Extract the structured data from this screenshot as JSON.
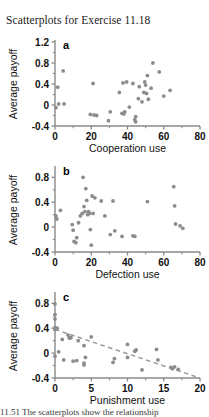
{
  "figure": {
    "title": "Scatterplots for Exercise 11.18",
    "bottom_caption": "11.51 The scatterplots show the relationship",
    "point_color": "#8c8c8c",
    "axis_color": "#8a8a8a",
    "text_color": "#111111",
    "trendline_color": "#9a9a9a"
  },
  "chart_data": [
    {
      "type": "scatter",
      "panel": "a",
      "title": "",
      "xlabel": "Cooperation use",
      "ylabel": "Average payoff",
      "xlim": [
        0,
        80
      ],
      "ylim": [
        -0.4,
        1.2
      ],
      "xticks": [
        0,
        20,
        40,
        60,
        80
      ],
      "yticks": [
        -0.4,
        0,
        0.4,
        0.8,
        1.2
      ],
      "xtick_labels": [
        "0",
        "20",
        "40",
        "60",
        "80"
      ],
      "ytick_labels": [
        "-0.4",
        "0",
        "0.4",
        "0.8",
        "1.2"
      ],
      "grid": false,
      "legend": "none",
      "x": [
        0.5,
        1.5,
        2.0,
        4.5,
        5.0,
        19.5,
        21.0,
        21.5,
        23.0,
        29.5,
        30.5,
        35.5,
        37.0,
        37.5,
        38.0,
        38.5,
        39.5,
        41.0,
        43.0,
        44.0,
        44.5,
        44.5,
        46.0,
        46.5,
        48.0,
        49.0,
        49.5,
        50.0,
        50.5,
        51.0,
        51.5,
        53.0,
        54.0,
        57.5,
        60.0,
        63.5
      ],
      "y": [
        -0.05,
        0.34,
        0.02,
        0.65,
        0.02,
        -0.18,
        0.41,
        -0.19,
        -0.2,
        -0.3,
        -0.13,
        0.24,
        -0.16,
        0.42,
        -0.17,
        -0.13,
        0.44,
        -0.04,
        0.41,
        -0.28,
        -0.32,
        -0.22,
        0.12,
        0.35,
        0.06,
        0.24,
        0.44,
        0.38,
        0.22,
        0.56,
        0.11,
        0.32,
        0.8,
        0.63,
        0.17,
        0.28
      ]
    },
    {
      "type": "scatter",
      "panel": "b",
      "title": "",
      "xlabel": "Defection use",
      "ylabel": "Average payoff",
      "xlim": [
        0,
        80
      ],
      "ylim": [
        -0.4,
        0.95
      ],
      "xticks": [
        0,
        20,
        40,
        60,
        80
      ],
      "yticks": [
        -0.4,
        0,
        0.4,
        0.8
      ],
      "xtick_labels": [
        "0",
        "20",
        "40",
        "60",
        "80"
      ],
      "ytick_labels": [
        "-0.4",
        "0",
        "0.4",
        "0.8"
      ],
      "grid": false,
      "legend": "none",
      "x": [
        0.5,
        1.0,
        3.0,
        9.5,
        10.0,
        10.5,
        11.5,
        12.0,
        13.0,
        14.0,
        15.0,
        15.5,
        16.0,
        16.5,
        17.0,
        17.5,
        18.0,
        18.5,
        19.0,
        19.5,
        20.0,
        20.5,
        21.0,
        22.0,
        25.5,
        27.5,
        30.5,
        32.0,
        33.0,
        37.0,
        43.0,
        44.0,
        51.0,
        65.5,
        66.0,
        66.5,
        69.0,
        70.5
      ],
      "y": [
        0.18,
        0.13,
        0.27,
        0.04,
        -0.05,
        -0.23,
        -0.25,
        -0.17,
        0.07,
        0.18,
        0.22,
        0.8,
        0.33,
        0.25,
        0.62,
        0.43,
        0.2,
        0.25,
        0.22,
        -0.04,
        -0.29,
        0.5,
        0.22,
        0.47,
        0.42,
        0.18,
        -0.12,
        0.42,
        -0.06,
        -0.15,
        -0.14,
        -0.15,
        0.41,
        0.65,
        0.34,
        0.05,
        0.02,
        -0.02
      ]
    },
    {
      "type": "scatter",
      "panel": "c",
      "title": "",
      "xlabel": "Punishment use",
      "ylabel": "Average payoff",
      "xlim": [
        0,
        20
      ],
      "ylim": [
        -0.4,
        0.95
      ],
      "xticks": [
        0,
        5,
        10,
        15,
        20
      ],
      "yticks": [
        -0.4,
        0,
        0.4,
        0.8
      ],
      "xtick_labels": [
        "0",
        "5",
        "10",
        "15",
        "20"
      ],
      "ytick_labels": [
        "-0.4",
        "0",
        "0.4",
        "0.8"
      ],
      "grid": false,
      "legend": "none",
      "x": [
        0.0,
        0.0,
        0.0,
        0.0,
        0.0,
        0.0,
        0.3,
        0.5,
        1.0,
        1.2,
        1.8,
        2.0,
        2.0,
        2.2,
        2.5,
        3.0,
        3.2,
        4.0,
        4.0,
        4.0,
        4.2,
        5.0,
        8.0,
        8.2,
        10.0,
        10.0,
        11.0,
        11.2,
        12.0,
        14.0,
        14.2,
        16.0,
        16.2,
        16.5,
        17.0
      ],
      "y": [
        0.79,
        0.62,
        0.55,
        0.41,
        0.38,
        -0.05,
        0.4,
        0.02,
        0.22,
        -0.11,
        0.29,
        0.25,
        0.24,
        0.25,
        -0.13,
        -0.12,
        0.2,
        0.12,
        -0.16,
        -0.19,
        -0.07,
        0.26,
        -0.15,
        -0.09,
        0.14,
        -0.07,
        0.03,
        0.05,
        -0.27,
        0.06,
        -0.11,
        -0.23,
        -0.25,
        -0.22,
        -0.26
      ],
      "trendline": {
        "style": "dashed",
        "x0": 0.0,
        "y0": 0.38,
        "x1": 20.0,
        "y1": -0.4
      }
    }
  ]
}
